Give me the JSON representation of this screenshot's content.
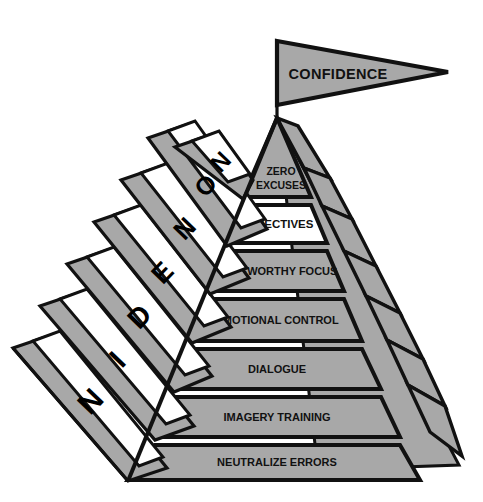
{
  "figure": {
    "type": "pyramid-with-staircase",
    "title_flag": "CONFIDENCE",
    "colors": {
      "fill_gray": "#a8a8a8",
      "fill_white": "#ffffff",
      "stroke": "#111111",
      "text": "#111111",
      "background": "#ffffff"
    }
  },
  "flag": {
    "label": "CONFIDENCE",
    "shape": "pennant",
    "fill": "#a8a8a8"
  },
  "pyramid": {
    "bands": [
      {
        "index": 0,
        "label": "ZERO EXCUSES",
        "label_line1": "ZERO",
        "label_line2": "EXCUSES",
        "fill": "#a8a8a8",
        "highlighted": false,
        "position": "apex"
      },
      {
        "index": 1,
        "label": "OBJECTIVES",
        "label_line1": "OBJECTIVES",
        "label_line2": "",
        "fill": "#ffffff",
        "highlighted": true,
        "position": "2"
      },
      {
        "index": 2,
        "label": "NOTEWORTHY FOCUS",
        "label_line1": "NOTEWORTHY FOCUS",
        "label_line2": "",
        "fill": "#a8a8a8",
        "highlighted": false,
        "position": "3"
      },
      {
        "index": 3,
        "label": "EMOTIONAL CONTROL",
        "label_line1": "EMOTIONAL CONTROL",
        "label_line2": "",
        "fill": "#a8a8a8",
        "highlighted": false,
        "position": "4"
      },
      {
        "index": 4,
        "label": "DIALOGUE",
        "label_line1": "DIALOGUE",
        "label_line2": "",
        "fill": "#a8a8a8",
        "highlighted": false,
        "position": "5"
      },
      {
        "index": 5,
        "label": "IMAGERY TRAINING",
        "label_line1": "IMAGERY TRAINING",
        "label_line2": "",
        "fill": "#a8a8a8",
        "highlighted": false,
        "position": "6"
      },
      {
        "index": 6,
        "label": "NEUTRALIZE ERRORS",
        "label_line1": "NEUTRALIZE ERRORS",
        "label_line2": "",
        "fill": "#a8a8a8",
        "highlighted": false,
        "position": "base"
      }
    ]
  },
  "staircase": {
    "description": "Seven ascending steps along the left face, each carrying one rotated capital letter",
    "letters": [
      {
        "index": 0,
        "char": "N",
        "step": "top"
      },
      {
        "index": 1,
        "char": "O",
        "step": "2"
      },
      {
        "index": 2,
        "char": "N",
        "step": "3"
      },
      {
        "index": 3,
        "char": "E",
        "step": "4"
      },
      {
        "index": 4,
        "char": "D",
        "step": "5"
      },
      {
        "index": 5,
        "char": "I",
        "step": "6"
      },
      {
        "index": 6,
        "char": "N",
        "step": "bottom"
      }
    ]
  }
}
